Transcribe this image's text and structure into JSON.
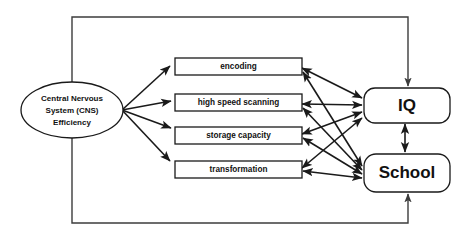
{
  "diagram": {
    "colors": {
      "stroke": "#1a1a1a",
      "frame_stroke": "#3c3c3c",
      "fill": "#ffffff",
      "text": "#111111"
    },
    "source_node": {
      "id": "cns",
      "shape": "ellipse",
      "lines": [
        "Central Nervous",
        "System (CNS)",
        "Efficiency"
      ]
    },
    "process_nodes": [
      {
        "id": "encoding",
        "label": "encoding"
      },
      {
        "id": "high-speed-scanning",
        "label": "high speed scanning"
      },
      {
        "id": "storage-capacity",
        "label": "storage capacity"
      },
      {
        "id": "transformation",
        "label": "transformation"
      }
    ],
    "outcome_nodes": [
      {
        "id": "iq",
        "label": "IQ"
      },
      {
        "id": "school",
        "label": "School"
      }
    ]
  }
}
